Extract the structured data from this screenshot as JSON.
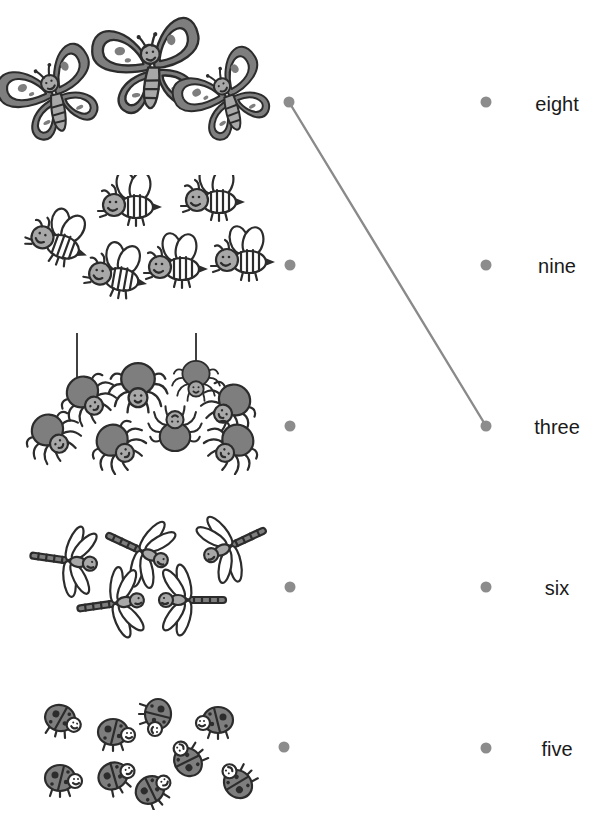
{
  "worksheet": {
    "type": "count-and-match",
    "left_column": [
      {
        "id": "butterflies",
        "animal": "butterfly",
        "count": 3,
        "dot": {
          "x": 289,
          "y": 102
        }
      },
      {
        "id": "bees",
        "animal": "bee",
        "count": 6,
        "dot": {
          "x": 290,
          "y": 265
        }
      },
      {
        "id": "spiders",
        "animal": "spider",
        "count": 8,
        "dot": {
          "x": 290,
          "y": 426
        }
      },
      {
        "id": "dragonflies",
        "animal": "dragonfly",
        "count": 5,
        "dot": {
          "x": 290,
          "y": 587
        }
      },
      {
        "id": "ladybugs",
        "animal": "ladybug",
        "count": 9,
        "dot": {
          "x": 284,
          "y": 747
        }
      }
    ],
    "right_column": [
      {
        "label": "eight",
        "dot": {
          "x": 486,
          "y": 102
        }
      },
      {
        "label": "nine",
        "dot": {
          "x": 486,
          "y": 265
        }
      },
      {
        "label": "three",
        "dot": {
          "x": 486,
          "y": 426
        }
      },
      {
        "label": "six",
        "dot": {
          "x": 486,
          "y": 587
        }
      },
      {
        "label": "five",
        "dot": {
          "x": 486,
          "y": 748
        }
      }
    ],
    "connections": [
      {
        "from": "butterflies",
        "to": "three"
      }
    ],
    "colors": {
      "dot": "#8c8c8c",
      "line": "#8a8a8a",
      "text": "#1a1a1a",
      "outline": "#2c2c2c",
      "fill_dark": "#7e7e7e",
      "fill_light": "#a8a8a8"
    }
  }
}
